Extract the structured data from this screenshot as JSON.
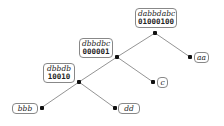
{
  "diagram": {
    "type": "binary-tree",
    "edge_color": "#888888",
    "nodes": [
      {
        "id": "root",
        "label": "dabbdabc",
        "bits": "01000100"
      },
      {
        "id": "n1",
        "label": "dbbdbc",
        "bits": "000001"
      },
      {
        "id": "n2",
        "label": "dbbdb",
        "bits": "10010"
      }
    ],
    "leaves": [
      {
        "id": "aa",
        "label": "aa"
      },
      {
        "id": "c",
        "label": "c"
      },
      {
        "id": "bbb",
        "label": "bbb"
      },
      {
        "id": "dd",
        "label": "dd"
      }
    ],
    "edges": [
      [
        "root",
        "n1"
      ],
      [
        "root",
        "aa"
      ],
      [
        "n1",
        "n2"
      ],
      [
        "n1",
        "c"
      ],
      [
        "n2",
        "bbb"
      ],
      [
        "n2",
        "dd"
      ]
    ]
  }
}
